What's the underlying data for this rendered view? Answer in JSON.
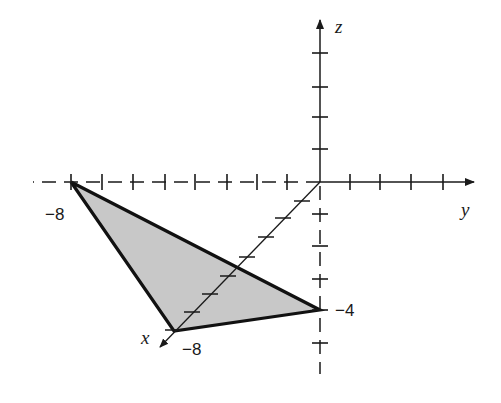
{
  "diagram": {
    "type": "3d-coordinate-plot",
    "axes": {
      "x": {
        "label": "x",
        "tick_label": "−8",
        "ticks": 8
      },
      "y": {
        "label": "y",
        "tick_label": "−8",
        "negative_ticks": 8,
        "positive_ticks": 4
      },
      "z": {
        "label": "z",
        "tick_label": "−4",
        "positive_ticks": 4,
        "negative_ticks": 5
      }
    },
    "triangle": {
      "vertices": [
        {
          "name": "A",
          "coords": [
            0,
            -8,
            0
          ]
        },
        {
          "name": "B",
          "coords": [
            -8,
            0,
            0
          ]
        },
        {
          "name": "C",
          "coords": [
            0,
            0,
            -4
          ]
        }
      ],
      "fill_color": "#c8c8c8",
      "stroke_color": "#111111"
    },
    "colors": {
      "axis": "#1a1a1a",
      "background": "#ffffff"
    }
  }
}
